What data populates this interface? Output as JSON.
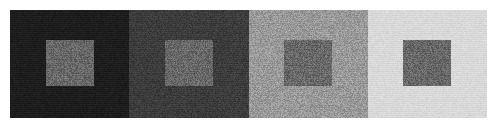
{
  "figure": {
    "kind": "simultaneous-contrast-illusion",
    "width_px": 497,
    "height_px": 128,
    "background_color": "#ffffff",
    "margin_px": 10,
    "panel_count": 4,
    "noise_texture": "film-grain",
    "title": "",
    "caption": ""
  },
  "panels": [
    {
      "index": 1,
      "name": "panel-darkest",
      "background_color": "#1a1a1a",
      "patch": {
        "name": "gray-patch-1",
        "color": "#676767",
        "width_px": 48,
        "height_px": 46
      }
    },
    {
      "index": 2,
      "name": "panel-dark",
      "background_color": "#3a3a3a",
      "patch": {
        "name": "gray-patch-2",
        "color": "#676767",
        "width_px": 48,
        "height_px": 46
      }
    },
    {
      "index": 3,
      "name": "panel-light",
      "background_color": "#9a9a9a",
      "patch": {
        "name": "gray-patch-3",
        "color": "#676767",
        "width_px": 48,
        "height_px": 46
      }
    },
    {
      "index": 4,
      "name": "panel-lightest",
      "background_color": "#dcdcdc",
      "patch": {
        "name": "gray-patch-4",
        "color": "#676767",
        "width_px": 48,
        "height_px": 46
      }
    }
  ]
}
